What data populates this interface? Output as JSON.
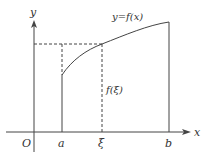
{
  "diagram": {
    "axes": {
      "x_label": "x",
      "y_label": "y",
      "origin_label": "O"
    },
    "curve_label": "y=f(x)",
    "value_label": "f(ξ)",
    "x_ticks": [
      {
        "label": "a"
      },
      {
        "label": "ξ"
      },
      {
        "label": "b"
      }
    ],
    "colors": {
      "line": "#444444",
      "text": "#333333",
      "background": "#ffffff"
    }
  }
}
